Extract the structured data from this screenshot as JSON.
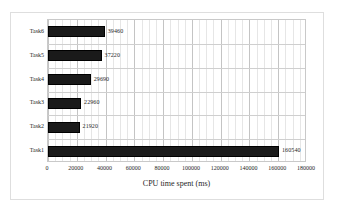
{
  "chart_data": {
    "type": "bar",
    "orientation": "horizontal",
    "title": "",
    "xlabel": "CPU time spent (ms)",
    "ylabel": "",
    "categories": [
      "Task6",
      "Task5",
      "Task4",
      "Task3",
      "Task2",
      "Task1"
    ],
    "values": [
      39460,
      37220,
      29690,
      22960,
      21920,
      160540
    ],
    "data_labels": [
      "39460",
      "37220",
      "29690",
      "22960",
      "21920",
      "160540"
    ],
    "xlim": [
      0,
      180000
    ],
    "xticks": [
      0,
      20000,
      40000,
      60000,
      80000,
      100000,
      120000,
      140000,
      160000,
      180000
    ],
    "xtick_labels": [
      "0",
      "20000",
      "40000",
      "60000",
      "80000",
      "100000",
      "120000",
      "140000",
      "160000",
      "180000"
    ],
    "xtick_step": 20000,
    "minor_ticks_per_major": 4,
    "grid": {
      "vertical_major": true,
      "vertical_minor": true,
      "horizontal": true
    },
    "legend": {
      "visible": false,
      "entries": []
    },
    "series": [
      {
        "name": "CPU time spent (ms)",
        "color": "#1a1a1a",
        "values": [
          39460,
          37220,
          29690,
          22960,
          21920,
          160540
        ]
      }
    ]
  },
  "colors": {
    "bar_fill": "#1a1a1a",
    "bar_edge": "#000000",
    "plot_border": "#c9c9c9",
    "grid_major": "#c4c4c4",
    "grid_minor": "#e6e6e6",
    "grid_horizontal": "#cfcfcf",
    "outer_frame": "#dedede",
    "background": "#ffffff",
    "text": "#1f1f1f"
  }
}
